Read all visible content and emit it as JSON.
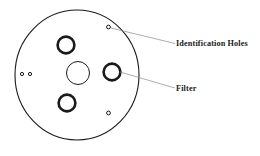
{
  "diagram": {
    "background_color": "#ffffff",
    "stroke_color": "#1a1a1a",
    "leader_color": "#8a8a8a",
    "disc": {
      "name": "filter-disc-outline",
      "center_x": 77,
      "center_y": 75,
      "radius_x": 62,
      "radius_y": 65,
      "stroke_width": 1.1
    },
    "center_hole": {
      "name": "center-bore",
      "cx": 78,
      "cy": 73,
      "r": 11.5,
      "stroke_width": 1.0
    },
    "filters": [
      {
        "name": "filter-upper-left",
        "cx": 66,
        "cy": 45,
        "r": 8.4,
        "stroke_width": 2.6
      },
      {
        "name": "filter-right",
        "cx": 112,
        "cy": 72,
        "r": 8.4,
        "stroke_width": 2.6
      },
      {
        "name": "filter-lower-left",
        "cx": 67,
        "cy": 103,
        "r": 8.4,
        "stroke_width": 2.6
      }
    ],
    "identification_holes": [
      {
        "name": "id-hole-top",
        "cx": 108.5,
        "cy": 27,
        "r": 1.9,
        "stroke_width": 1.0
      },
      {
        "name": "id-hole-bottom",
        "cx": 108.5,
        "cy": 113,
        "r": 1.9,
        "stroke_width": 1.0
      },
      {
        "name": "id-hole-left-inner",
        "cx": 30,
        "cy": 74,
        "r": 1.6,
        "stroke_width": 1.0
      },
      {
        "name": "id-hole-left-outer",
        "cx": 22,
        "cy": 74,
        "r": 1.6,
        "stroke_width": 1.0
      }
    ],
    "leaders": [
      {
        "name": "leader-identification-holes",
        "x1": 111,
        "y1": 28,
        "x2": 175,
        "y2": 43.5
      },
      {
        "name": "leader-filter",
        "x1": 120,
        "y1": 72,
        "x2": 175,
        "y2": 88
      }
    ],
    "labels": [
      {
        "name": "label-identification-holes",
        "text": "Identification Holes",
        "x": 176,
        "y": 45.5
      },
      {
        "name": "label-filter",
        "text": "Filter",
        "x": 176,
        "y": 90.5
      }
    ]
  }
}
